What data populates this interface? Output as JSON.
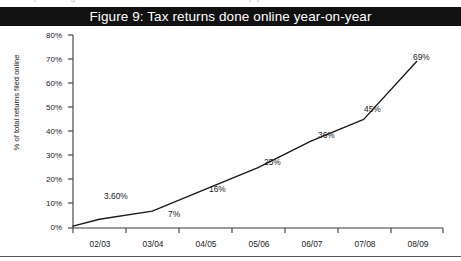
{
  "page": {
    "cutoff_text": "the percentage of tax returns filed online has risen sharply",
    "bottom_rule_color": "#555555"
  },
  "title": {
    "text": "Figure 9: Tax returns done online year-on-year",
    "background": "#111111",
    "color": "#ffffff"
  },
  "axes": {
    "ylabel": "% of total returns filed online",
    "yticks": [
      "0%",
      "10%",
      "20%",
      "30%",
      "40%",
      "50%",
      "60%",
      "70%",
      "80%"
    ],
    "xticks": [
      "02/03",
      "03/04",
      "04/05",
      "05/06",
      "06/07",
      "07/08",
      "08/09"
    ]
  },
  "chart_data": {
    "type": "line",
    "title": "Figure 9: Tax returns done online year-on-year",
    "xlabel": "",
    "ylabel": "% of total returns filed online",
    "categories": [
      "02/03",
      "03/04",
      "04/05",
      "05/06",
      "06/07",
      "07/08",
      "08/09"
    ],
    "values": [
      3.6,
      7,
      16,
      25,
      36,
      45,
      69
    ],
    "point_labels": [
      "3.60%",
      "7%",
      "16%",
      "25%",
      "36%",
      "45%",
      "69%"
    ],
    "ylim": [
      0,
      80
    ],
    "ytick_values": [
      0,
      10,
      20,
      30,
      40,
      50,
      60,
      70,
      80
    ],
    "grid": false,
    "legend": false,
    "line_color": "#1a1a1a",
    "markers": false
  }
}
